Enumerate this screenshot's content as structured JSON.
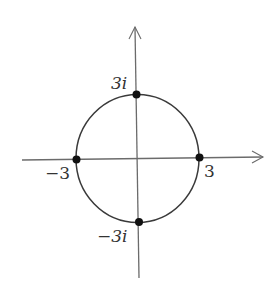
{
  "diagram": {
    "type": "complex-plane-circle",
    "labels": {
      "top": "3i",
      "bottom": "−3i",
      "left": "−3",
      "right": "3"
    },
    "points": [
      {
        "name": "3i",
        "re": 0,
        "im": 3
      },
      {
        "name": "-3i",
        "re": 0,
        "im": -3
      },
      {
        "name": "-3",
        "re": -3,
        "im": 0
      },
      {
        "name": "3",
        "re": 3,
        "im": 0
      }
    ],
    "radius": 3,
    "colors": {
      "axis": "#6b6b6b",
      "circle": "#3a3a3a",
      "point": "#111111",
      "text": "#333333"
    }
  }
}
